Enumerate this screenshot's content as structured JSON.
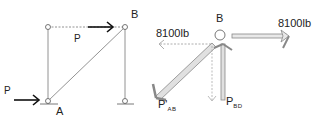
{
  "truss": {
    "labels": {
      "node_b": "B",
      "node_a": "A",
      "load_top": "P",
      "load_left": "P"
    }
  },
  "free_body": {
    "labels": {
      "node_b": "B",
      "force_left": "8100lb",
      "force_right": "8100lb",
      "member_ab": "P'",
      "member_ab_sub": "AB",
      "member_bd": "P",
      "member_bd_sub": "BD"
    }
  }
}
